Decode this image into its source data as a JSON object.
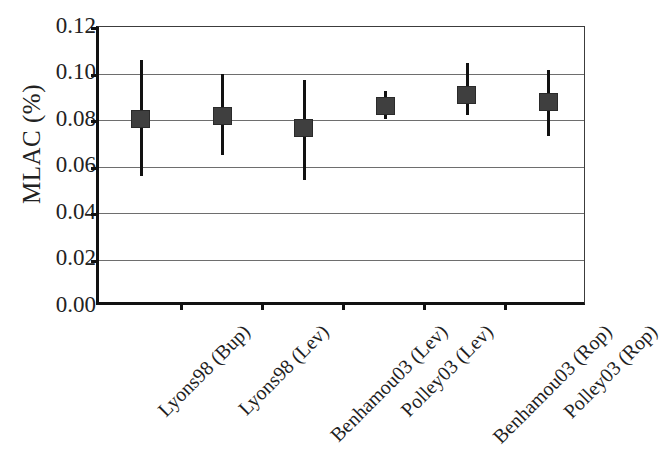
{
  "chart_data": {
    "type": "scatter",
    "title": "",
    "xlabel": "",
    "ylabel": "MLAC (%)",
    "ylim": [
      0.0,
      0.12
    ],
    "ytick_labels": [
      "0.12",
      "0.10",
      "0.08",
      "0.06",
      "0.04",
      "0.02",
      "0.00"
    ],
    "ytick_values": [
      0.12,
      0.1,
      0.08,
      0.06,
      0.04,
      0.02,
      0.0
    ],
    "grid": "horizontal",
    "legend": "none",
    "marker_style": "filled-square-with-error-bars",
    "categories": [
      "Lyons98 (Bup)",
      "Lyons98 (Lev)",
      "Benhamou03 (Lev)",
      "Polley03 (Lev)",
      "Benhamou03 (Rop)",
      "Polley03 (Rop)"
    ],
    "values": [
      0.081,
      0.082,
      0.077,
      0.0865,
      0.091,
      0.088
    ],
    "error_low": [
      0.056,
      0.065,
      0.054,
      0.0805,
      0.082,
      0.073
    ],
    "error_high": [
      0.106,
      0.1,
      0.097,
      0.0925,
      0.1045,
      0.1015
    ],
    "points": [
      {
        "category": "Lyons98 (Bup)",
        "value": 0.081,
        "ci_low": 0.056,
        "ci_high": 0.106
      },
      {
        "category": "Lyons98 (Lev)",
        "value": 0.082,
        "ci_low": 0.065,
        "ci_high": 0.1
      },
      {
        "category": "Benhamou03 (Lev)",
        "value": 0.077,
        "ci_low": 0.054,
        "ci_high": 0.097
      },
      {
        "category": "Polley03 (Lev)",
        "value": 0.0865,
        "ci_low": 0.0805,
        "ci_high": 0.0925
      },
      {
        "category": "Benhamou03 (Rop)",
        "value": 0.091,
        "ci_low": 0.082,
        "ci_high": 0.1045
      },
      {
        "category": "Polley03 (Rop)",
        "value": 0.088,
        "ci_low": 0.073,
        "ci_high": 0.1015
      }
    ],
    "colors": {
      "marker": "#3f3f3f",
      "error_bar": "#111111",
      "gridline": "#6e6e6e",
      "axis": "#111111",
      "background": "#ffffff"
    }
  }
}
